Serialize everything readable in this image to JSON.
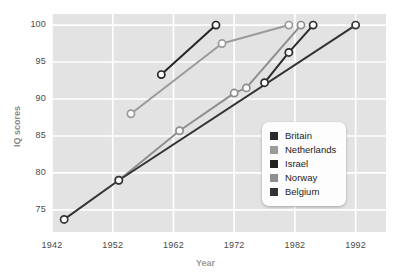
{
  "chart_data": {
    "type": "line",
    "title": "",
    "xlabel": "Year",
    "ylabel": "IQ scores",
    "xlim": [
      1942,
      1997
    ],
    "ylim": [
      72,
      101.5
    ],
    "xticks": [
      1942,
      1952,
      1962,
      1972,
      1982,
      1992
    ],
    "yticks": [
      75,
      80,
      85,
      90,
      95,
      100
    ],
    "grid": true,
    "legend_position": "inside-lower-right",
    "series": [
      {
        "name": "Britain",
        "color": "#2b2b2b",
        "points": [
          {
            "x": 1977,
            "y": 92.2
          },
          {
            "x": 1981,
            "y": 96.3
          },
          {
            "x": 1985,
            "y": 100.0
          }
        ]
      },
      {
        "name": "Netherlands",
        "color": "#9a9a9a",
        "points": [
          {
            "x": 1955,
            "y": 88.0
          },
          {
            "x": 1970,
            "y": 97.5
          },
          {
            "x": 1981,
            "y": 100.0
          }
        ]
      },
      {
        "name": "Israel",
        "color": "#262626",
        "points": [
          {
            "x": 1960,
            "y": 93.3
          },
          {
            "x": 1969,
            "y": 100.0
          }
        ]
      },
      {
        "name": "Norway",
        "color": "#8e8e8e",
        "points": [
          {
            "x": 1953,
            "y": 79.0
          },
          {
            "x": 1963,
            "y": 85.7
          },
          {
            "x": 1972,
            "y": 90.8
          },
          {
            "x": 1974,
            "y": 91.5
          },
          {
            "x": 1983,
            "y": 100.0
          }
        ]
      },
      {
        "name": "Belgium",
        "color": "#333333",
        "points": [
          {
            "x": 1944,
            "y": 73.7
          },
          {
            "x": 1953,
            "y": 79.0
          },
          {
            "x": 1992,
            "y": 100.0
          }
        ]
      }
    ]
  },
  "legend": {
    "items": [
      {
        "label": "Britain",
        "color": "#2b2b2b"
      },
      {
        "label": "Netherlands",
        "color": "#9a9a9a"
      },
      {
        "label": "Israel",
        "color": "#1f1f1f"
      },
      {
        "label": "Norway",
        "color": "#8e8e8e"
      },
      {
        "label": "Belgium",
        "color": "#333333"
      }
    ]
  },
  "style": {
    "plot_background": "#e3e3e3",
    "gridline_color": "#ffffff",
    "marker_fill": "#ffffff",
    "page_background": "#ffffff"
  }
}
